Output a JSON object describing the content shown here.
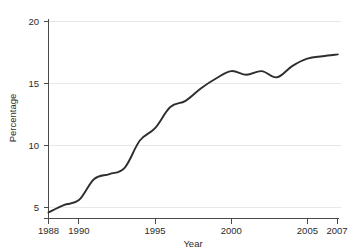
{
  "chart_data": {
    "type": "line",
    "title": "",
    "subtitle": "",
    "xlabel": "Year",
    "ylabel": "Percentage",
    "xlim": [
      1987.4,
      2007.4
    ],
    "ylim": [
      4.0,
      20.6
    ],
    "xticks": [
      1988,
      1990,
      1995,
      2000,
      2005,
      2007
    ],
    "xticklabels": [
      "1988",
      "1990",
      "1995",
      "2000",
      "2005",
      "2007"
    ],
    "yticks": [
      5,
      10,
      15,
      20
    ],
    "yticklabels": [
      "5",
      "10",
      "15",
      "20"
    ],
    "grid": "horizontal",
    "legend": "none",
    "line_color": "#2e2e2e",
    "grid_color": "#e8e8e8",
    "axis_color": "#4a4a4a",
    "x": [
      1988,
      1989,
      1990,
      1991,
      1992,
      1993,
      1994,
      1995,
      1996,
      1997,
      1998,
      1999,
      2000,
      2001,
      2002,
      2003,
      2004,
      2005,
      2006,
      2007
    ],
    "values": [
      4.6,
      5.2,
      5.6,
      7.3,
      7.7,
      8.2,
      10.4,
      11.4,
      13.1,
      13.6,
      14.6,
      15.4,
      16.0,
      15.7,
      16.0,
      15.5,
      16.4,
      17.0,
      17.2,
      17.35
    ],
    "series": [
      {
        "name": "Percentage",
        "values": [
          4.6,
          5.2,
          5.6,
          7.3,
          7.7,
          8.2,
          10.4,
          11.4,
          13.1,
          13.6,
          14.6,
          15.4,
          16.0,
          15.7,
          16.0,
          15.5,
          16.4,
          17.0,
          17.2,
          17.35
        ]
      }
    ],
    "annotations": []
  },
  "labels": {
    "y_tick_0": "5",
    "y_tick_1": "10",
    "y_tick_2": "15",
    "y_tick_3": "20",
    "x_tick_0": "1988",
    "x_tick_1": "1990",
    "x_tick_2": "1995",
    "x_tick_3": "2000",
    "x_tick_4": "2005",
    "x_tick_5": "2007",
    "x_axis_title": "Year",
    "y_axis_title": "Percentage"
  }
}
